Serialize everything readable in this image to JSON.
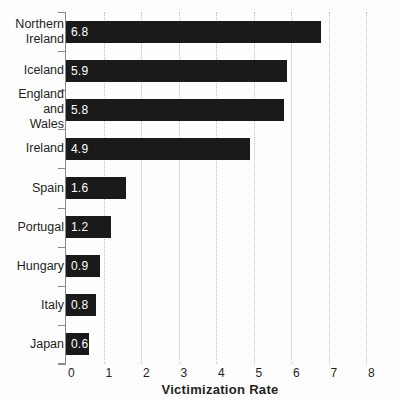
{
  "chart_data": {
    "type": "bar",
    "orientation": "horizontal",
    "title": "",
    "xlabel": "Victimization Rate",
    "ylabel": "",
    "xlim": [
      0,
      8
    ],
    "xticks": [
      0,
      1,
      2,
      3,
      4,
      5,
      6,
      7,
      8
    ],
    "grid": "vertical-dotted",
    "legend": "none",
    "bar_color": "#1a1a1a",
    "value_label_color": "#ffffff",
    "gridline_color": "#bfbfbf",
    "axis_color": "#8a8a8a",
    "categories": [
      "Northern Ireland",
      "Iceland",
      "England and Wales",
      "Ireland",
      "Spain",
      "Portugal",
      "Hungary",
      "Italy",
      "Japan"
    ],
    "category_label_lines": [
      [
        "Northern",
        "Ireland"
      ],
      [
        "Iceland"
      ],
      [
        "England",
        "and",
        "Wales"
      ],
      [
        "Ireland"
      ],
      [
        "Spain"
      ],
      [
        "Portugal"
      ],
      [
        "Hungary"
      ],
      [
        "Italy"
      ],
      [
        "Japan"
      ]
    ],
    "values": [
      6.8,
      5.9,
      5.8,
      4.9,
      1.6,
      1.2,
      0.9,
      0.8,
      0.6
    ],
    "value_labels": [
      "6.8",
      "5.9",
      "5.8",
      "4.9",
      "1.6",
      "1.2",
      "0.9",
      "0.8",
      "0.6"
    ]
  }
}
